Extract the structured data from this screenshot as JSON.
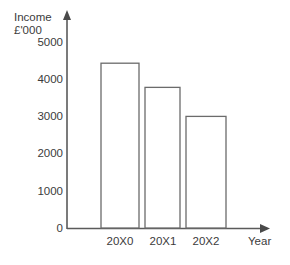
{
  "chart_data": {
    "type": "bar",
    "title": "",
    "subtitle": "",
    "ylabel_line1": "Income",
    "ylabel_line2": "£'000",
    "xlabel": "Year",
    "categories": [
      "20X0",
      "20X1",
      "20X2"
    ],
    "values": [
      4430,
      3780,
      3000
    ],
    "series": [
      {
        "name": "Income",
        "values": [
          4430,
          3780,
          3000
        ]
      }
    ],
    "ylim": [
      0,
      5000
    ],
    "yticks": [
      0,
      1000,
      2000,
      3000,
      4000,
      5000
    ],
    "ytick_labels": [
      "0",
      "1000",
      "2000",
      "3000",
      "4000",
      "5000"
    ],
    "grid": false,
    "legend": false,
    "legend_position": "none",
    "bar_fill_color": "#ffffff",
    "bar_border_color": "#6b6b6b",
    "axis_color": "#5a5a5a",
    "text_color": "#3b3b3b",
    "background_color": "#ffffff"
  },
  "axes": {
    "y_axis_name": "income-axis",
    "x_axis_name": "year-axis"
  }
}
